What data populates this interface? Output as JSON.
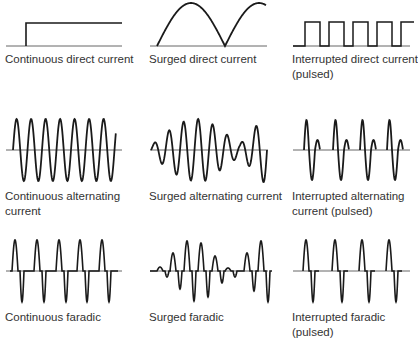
{
  "stroke_color": "#1a1a1a",
  "baseline_color": "#555555",
  "panels": [
    {
      "id": "continuous-dc",
      "label_line1": "Continuous direct current",
      "label_line2": ""
    },
    {
      "id": "surged-dc",
      "label_line1": "Surged direct current",
      "label_line2": ""
    },
    {
      "id": "interrupted-dc",
      "label_line1": "Interrupted direct current",
      "label_line2": "(pulsed)"
    },
    {
      "id": "continuous-ac",
      "label_line1": "Continuous alternating",
      "label_line2": "current"
    },
    {
      "id": "surged-ac",
      "label_line1": "Surged alternating current",
      "label_line2": ""
    },
    {
      "id": "interrupted-ac",
      "label_line1": "Interrupted alternating",
      "label_line2": "current (pulsed)"
    },
    {
      "id": "continuous-faradic",
      "label_line1": "Continuous faradic",
      "label_line2": ""
    },
    {
      "id": "surged-faradic",
      "label_line1": "Surged faradic",
      "label_line2": ""
    },
    {
      "id": "interrupted-faradic",
      "label_line1": "Interrupted faradic",
      "label_line2": "(pulsed)"
    }
  ]
}
